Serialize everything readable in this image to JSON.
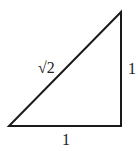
{
  "diagram": {
    "type": "right-triangle",
    "stroke_color": "#1a1a1a",
    "vertices": {
      "bottom_left": [
        9,
        126
      ],
      "bottom_right": [
        121,
        126
      ],
      "top_right": [
        121,
        12
      ]
    },
    "labels": {
      "hypotenuse": "√2",
      "vertical_leg": "1",
      "horizontal_leg": "1"
    }
  }
}
